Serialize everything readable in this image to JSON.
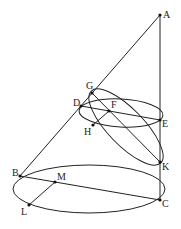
{
  "diagram": {
    "type": "geometry-cone-sections",
    "colors": {
      "stroke": "#222222",
      "background": "#ffffff"
    },
    "points": [
      {
        "id": "A",
        "label": "A",
        "x": 160,
        "y": 15
      },
      {
        "id": "G",
        "label": "G",
        "x": 92,
        "y": 93
      },
      {
        "id": "D",
        "label": "D",
        "x": 81,
        "y": 106
      },
      {
        "id": "F",
        "label": "F",
        "x": 109,
        "y": 111
      },
      {
        "id": "H",
        "label": "H",
        "x": 93,
        "y": 125
      },
      {
        "id": "E",
        "label": "E",
        "x": 160,
        "y": 120
      },
      {
        "id": "K",
        "label": "K",
        "x": 160,
        "y": 162
      },
      {
        "id": "B",
        "label": "B",
        "x": 20,
        "y": 176
      },
      {
        "id": "M",
        "label": "M",
        "x": 55,
        "y": 182
      },
      {
        "id": "L",
        "label": "L",
        "x": 29,
        "y": 205
      },
      {
        "id": "C",
        "label": "C",
        "x": 160,
        "y": 200
      }
    ],
    "segments": [
      "AB",
      "AC",
      "DE",
      "GK",
      "FH",
      "BC",
      "ML"
    ],
    "ellipses": [
      "circle DE (section parallel to base)",
      "ellipse GK (oblique section)",
      "base circle BC"
    ]
  }
}
